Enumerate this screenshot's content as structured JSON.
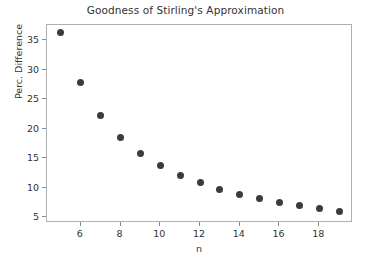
{
  "chart_data": {
    "type": "scatter",
    "title": "Goodness of Stirling's Approximation",
    "xlabel": "n",
    "ylabel": "Perc. Difference",
    "x": [
      5,
      6,
      7,
      8,
      9,
      10,
      11,
      12,
      13,
      14,
      15,
      16,
      17,
      18,
      19
    ],
    "values": [
      36.4,
      27.8,
      22.3,
      18.5,
      15.8,
      13.7,
      12.1,
      10.8,
      9.7,
      8.9,
      8.1,
      7.5,
      7.0,
      6.5,
      6.0
    ],
    "xticks": [
      6,
      8,
      10,
      12,
      14,
      16,
      18
    ],
    "yticks": [
      5,
      10,
      15,
      20,
      25,
      30,
      35
    ],
    "xlim": [
      4.3,
      19.7
    ],
    "ylim": [
      4.0,
      37.6
    ],
    "grid": false,
    "legend": null,
    "marker_color": "#3b3b3b",
    "axis_color": "#b0b0b0",
    "text_color": "#333333",
    "background_color": "#ffffff"
  }
}
